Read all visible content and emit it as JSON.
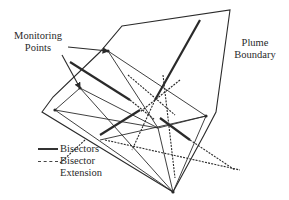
{
  "labels": {
    "monitoring_line1": "Monitoring",
    "monitoring_line2": "Points",
    "plume_line1": "Plume",
    "plume_line2": "Boundary"
  },
  "legend": {
    "items": [
      {
        "style": "solid",
        "label": "Bisectors"
      },
      {
        "style": "dashed",
        "label": "Bisector"
      },
      {
        "style": "none",
        "label": "Extension"
      }
    ]
  },
  "colors": {
    "line": "#2a2a2a",
    "background": "#ffffff"
  },
  "geometry": {
    "plume_boundary": "122,26 230,10 216,112 204,135 173,192 42,112 53,97 100,52",
    "monitoring_points": [
      [
        108,
        51
      ],
      [
        80,
        88
      ],
      [
        206,
        116
      ],
      [
        173,
        192
      ],
      [
        55,
        110
      ]
    ],
    "triangulation": [
      [
        108,
        51,
        158,
        128
      ],
      [
        108,
        51,
        206,
        116
      ],
      [
        80,
        88,
        158,
        128
      ],
      [
        80,
        88,
        173,
        192
      ],
      [
        55,
        110,
        173,
        192
      ],
      [
        55,
        110,
        158,
        128
      ],
      [
        158,
        128,
        206,
        116
      ],
      [
        158,
        128,
        173,
        192
      ],
      [
        206,
        116,
        173,
        192
      ],
      [
        80,
        88,
        55,
        110
      ],
      [
        100,
        140,
        206,
        116
      ]
    ],
    "bisectors": [
      [
        70,
        62,
        130,
        100
      ],
      [
        200,
        20,
        155,
        100
      ],
      [
        100,
        135,
        140,
        110
      ],
      [
        160,
        118,
        190,
        140
      ]
    ],
    "extensions": [
      [
        130,
        100,
        155,
        120
      ],
      [
        155,
        100,
        132,
        150
      ],
      [
        163,
        75,
        175,
        178
      ],
      [
        180,
        80,
        140,
        112
      ],
      [
        105,
        140,
        240,
        170
      ],
      [
        85,
        140,
        60,
        163
      ],
      [
        190,
        140,
        235,
        170
      ],
      [
        128,
        75,
        175,
        115
      ]
    ],
    "arrows": [
      [
        68,
        47,
        108,
        51
      ],
      [
        62,
        55,
        80,
        88
      ]
    ]
  }
}
